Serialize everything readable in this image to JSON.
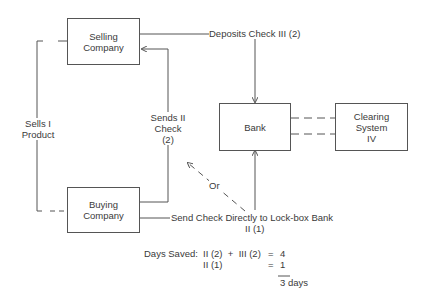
{
  "nodes": {
    "selling": {
      "line1": "Selling",
      "line2": "Company"
    },
    "buying": {
      "line1": "Buying",
      "line2": "Company"
    },
    "bank": {
      "label": "Bank"
    },
    "clearing": {
      "line1": "Clearing",
      "line2": "System",
      "line3": "IV"
    }
  },
  "edges": {
    "sells": {
      "line1": "Sells I",
      "line2": "Product"
    },
    "sends": {
      "line1": "Sends II",
      "line2": "Check",
      "line3": "(2)"
    },
    "deposits": {
      "label": "Deposits Check  III (2)"
    },
    "or": {
      "label": "Or"
    },
    "direct": {
      "line1": "Send Check Directly to Lock-box Bank",
      "line2": "II (1)"
    }
  },
  "calculation": {
    "title": "Days Saved:",
    "row1_expr": "II (2)  +  III (2)",
    "row1_eq": "=",
    "row1_val": "4",
    "row2_expr": "II (1)",
    "row2_eq": "=",
    "row2_val": "1",
    "result": "3 days"
  },
  "colors": {
    "line": "#555555",
    "text": "#3a3a3a"
  }
}
